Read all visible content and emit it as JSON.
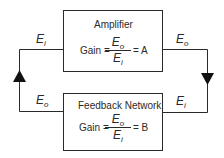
{
  "diagram": {
    "type": "feedback-loop-block-diagram",
    "colors": {
      "line": "#2a2a2a",
      "background": "#ffffff"
    },
    "amplifier": {
      "title": "Amplifier",
      "gain_label": "Gain =",
      "numerator": {
        "base": "E",
        "sub": "o"
      },
      "denominator": {
        "base": "E",
        "sub": "i"
      },
      "result": "= A"
    },
    "feedback": {
      "title": "Feedback Network",
      "gain_label": "Gain =",
      "numerator": {
        "base": "E",
        "sub": "o"
      },
      "denominator": {
        "base": "E",
        "sub": "i"
      },
      "result": "= B"
    },
    "signals": {
      "top_left": {
        "base": "E",
        "sub": "i"
      },
      "top_right": {
        "base": "E",
        "sub": "o"
      },
      "bottom_left": {
        "base": "E",
        "sub": "o"
      },
      "bottom_right": {
        "base": "E",
        "sub": "i"
      }
    },
    "arrows": {
      "left": "up-arrow",
      "right": "down-arrow"
    }
  }
}
